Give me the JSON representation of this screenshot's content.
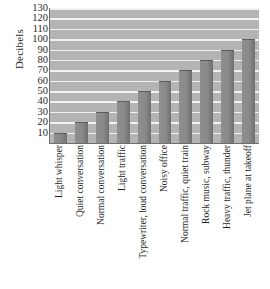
{
  "chart_data": {
    "type": "bar",
    "title": "",
    "xlabel": "",
    "ylabel": "Decibels",
    "ylim": [
      0,
      130
    ],
    "yticks": [
      10,
      20,
      30,
      40,
      50,
      60,
      70,
      80,
      90,
      100,
      110,
      120,
      130
    ],
    "grid": true,
    "legend": "none",
    "categories": [
      "Light whisper",
      "Quiet conversation",
      "Normal conversation",
      "Light traffic",
      "Typewriter, loud conversation",
      "Noisy office",
      "Normal traffic, quiet train",
      "Rock music, subway",
      "Heavy traffic, thunder",
      "Jet plane at takeoff"
    ],
    "values": [
      10,
      20,
      30,
      40,
      50,
      60,
      70,
      80,
      90,
      100
    ],
    "colors": {
      "bar": "#8a8a8a",
      "plot_background": "#b4b4b4",
      "gridline": "#f2f2f2",
      "axis": "#6d6d6d",
      "text": "#1f1f1f"
    }
  }
}
